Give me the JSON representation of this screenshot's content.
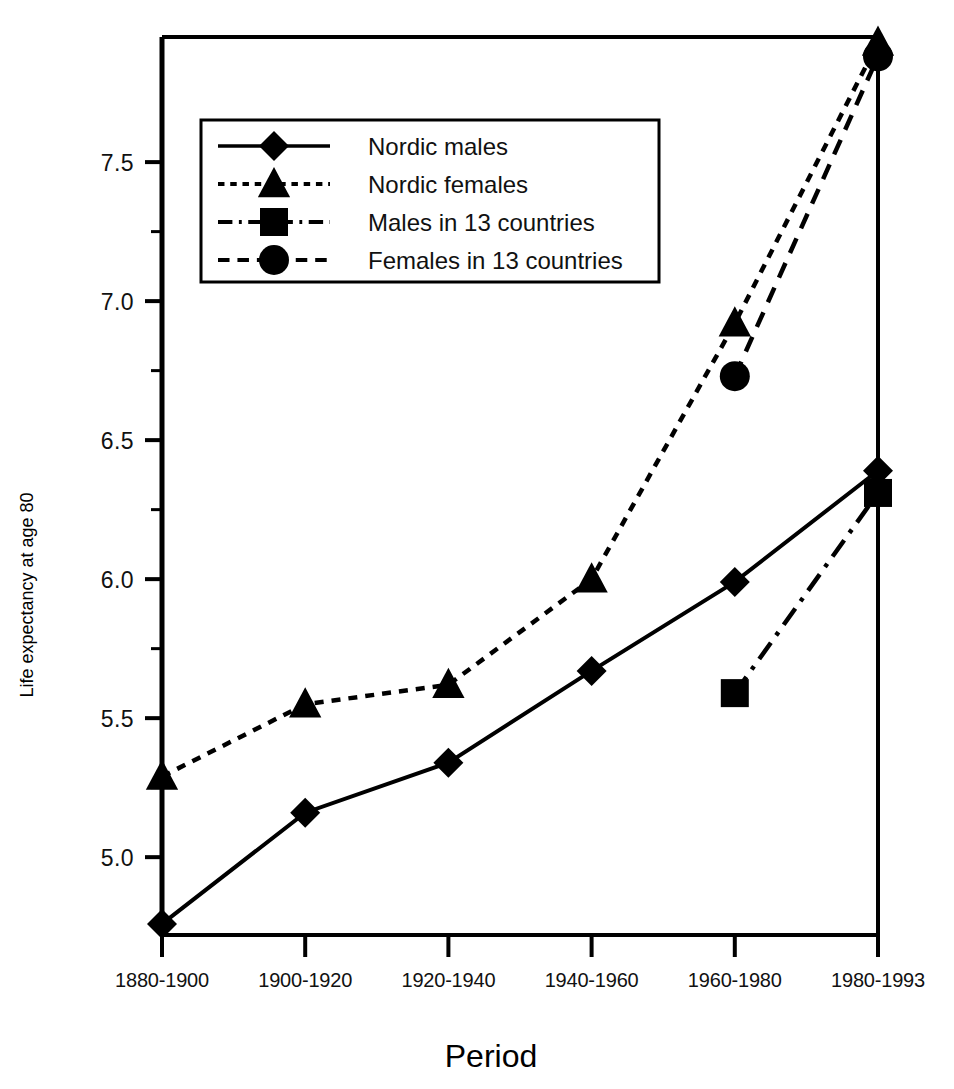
{
  "chart_data": {
    "type": "line",
    "title": "",
    "xlabel": "Period",
    "ylabel": "Life expectancy at age 80",
    "categories": [
      "1880-1900",
      "1900-1920",
      "1920-1940",
      "1940-1960",
      "1960-1980",
      "1980-1993"
    ],
    "ylim": [
      4.72,
      7.95
    ],
    "yticks": [
      "5.0",
      "5.5",
      "6.0",
      "6.5",
      "7.0",
      "7.5"
    ],
    "ytick_values": [
      5.0,
      5.5,
      6.0,
      6.5,
      7.0,
      7.5
    ],
    "minor_yticks": [
      5.25,
      5.75,
      6.25,
      6.75,
      7.25
    ],
    "grid": false,
    "legend_position": "upper-left",
    "series": [
      {
        "name": "Nordic males",
        "marker": "diamond",
        "line_style": "solid",
        "x": [
          "1880-1900",
          "1900-1920",
          "1920-1940",
          "1940-1960",
          "1960-1980",
          "1980-1993"
        ],
        "values": [
          4.76,
          5.16,
          5.34,
          5.67,
          5.99,
          6.39
        ]
      },
      {
        "name": "Nordic females",
        "marker": "triangle",
        "line_style": "dotted",
        "x": [
          "1880-1900",
          "1900-1920",
          "1920-1940",
          "1940-1960",
          "1960-1980",
          "1980-1993"
        ],
        "values": [
          5.29,
          5.55,
          5.62,
          6.0,
          6.92,
          7.93
        ]
      },
      {
        "name": "Males in 13 countries",
        "marker": "square",
        "line_style": "dash-dot",
        "x": [
          "1960-1980",
          "1980-1993"
        ],
        "values": [
          5.59,
          6.31
        ]
      },
      {
        "name": "Females in 13 countries",
        "marker": "circle",
        "line_style": "dashed",
        "x": [
          "1960-1980",
          "1980-1993"
        ],
        "values": [
          6.73,
          7.88
        ]
      }
    ]
  },
  "legend": {
    "items": [
      {
        "label": "Nordic males",
        "marker": "diamond",
        "line_style": "solid"
      },
      {
        "label": "Nordic females",
        "marker": "triangle",
        "line_style": "dotted"
      },
      {
        "label": "Males in 13 countries",
        "marker": "square",
        "line_style": "dash-dot"
      },
      {
        "label": "Females in 13 countries",
        "marker": "circle",
        "line_style": "dashed"
      }
    ]
  },
  "colors": {
    "ink": "#000000",
    "background": "#ffffff"
  }
}
